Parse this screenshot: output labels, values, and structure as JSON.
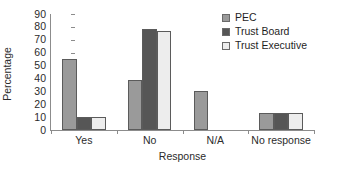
{
  "chart_data": {
    "type": "bar",
    "title": "",
    "xlabel": "Response",
    "ylabel": "Percentage",
    "categories": [
      "Yes",
      "No",
      "N/A",
      "No response"
    ],
    "series": [
      {
        "name": "PEC",
        "color": "#9a9a9a",
        "values": [
          55,
          39,
          30,
          13
        ]
      },
      {
        "name": "Trust Board",
        "color": "#565656",
        "values": [
          10,
          78,
          0,
          13
        ]
      },
      {
        "name": "Trust Executive",
        "color": "#ededed",
        "values": [
          10,
          77,
          0,
          13
        ]
      }
    ],
    "ylim": [
      0,
      90
    ],
    "ytick_values": [
      0,
      10,
      20,
      30,
      40,
      50,
      60,
      70,
      80,
      90
    ],
    "ytick_labels": [
      "0",
      "10",
      "20",
      "30",
      "40",
      "50",
      "60",
      "70",
      "80",
      "90"
    ],
    "grid": false,
    "legend_position": "top-right",
    "legend_orientation": "vertical",
    "bar_border_color": "#5b5b5b",
    "axis_color": "#8c8c8c"
  },
  "legend": {
    "entries": [
      {
        "label": "PEC"
      },
      {
        "label": "Trust Board"
      },
      {
        "label": "Trust Executive"
      }
    ]
  }
}
